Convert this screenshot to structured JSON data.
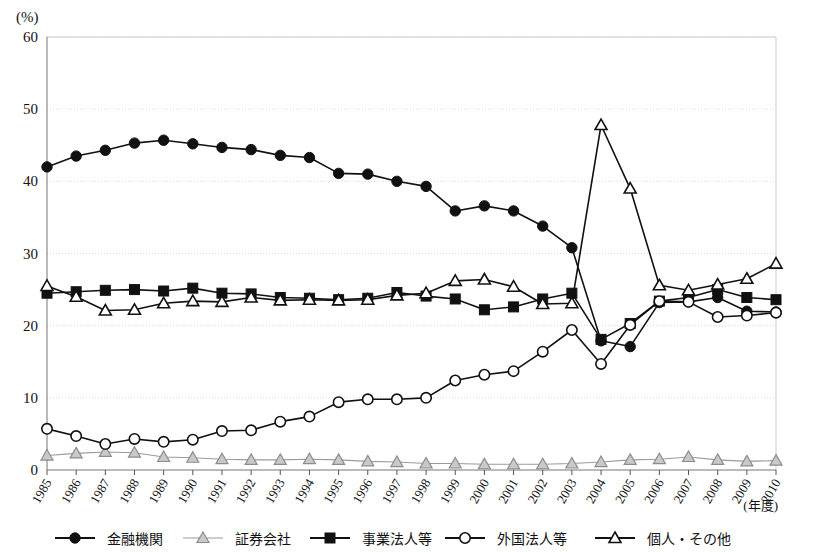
{
  "chart_data": {
    "type": "line",
    "title": "",
    "subtitle": "",
    "xlabel": "(年度)",
    "ylabel": "(%)",
    "ylim": [
      0,
      60
    ],
    "ytick_step": 10,
    "yticks": [
      "0",
      "10",
      "20",
      "30",
      "40",
      "50",
      "60"
    ],
    "grid": true,
    "legend_position": "bottom",
    "categories": [
      "1985",
      "1986",
      "1987",
      "1988",
      "1989",
      "1990",
      "1991",
      "1992",
      "1993",
      "1994",
      "1995",
      "1996",
      "1997",
      "1998",
      "1999",
      "2000",
      "2001",
      "2002",
      "2003",
      "2004",
      "2005",
      "2006",
      "2007",
      "2008",
      "2009",
      "2010"
    ],
    "series": [
      {
        "name": "金融機関",
        "marker": "filled-circle",
        "color": "#111111",
        "values": [
          42.0,
          43.5,
          44.3,
          45.3,
          45.7,
          45.2,
          44.7,
          44.4,
          43.6,
          43.3,
          41.1,
          41.0,
          40.0,
          39.3,
          35.9,
          36.6,
          35.9,
          33.8,
          30.8,
          17.9,
          17.1,
          23.2,
          23.3,
          23.9,
          22.0,
          21.9
        ]
      },
      {
        "name": "証券会社",
        "marker": "light-triangle",
        "color": "#9a9a9a",
        "values": [
          2.0,
          2.3,
          2.5,
          2.4,
          1.8,
          1.7,
          1.5,
          1.4,
          1.4,
          1.5,
          1.4,
          1.2,
          1.1,
          0.9,
          0.9,
          0.8,
          0.8,
          0.8,
          0.9,
          1.1,
          1.4,
          1.5,
          1.8,
          1.4,
          1.2,
          1.3
        ]
      },
      {
        "name": "事業法人等",
        "marker": "filled-square",
        "color": "#111111",
        "values": [
          24.5,
          24.7,
          24.9,
          25.0,
          24.8,
          25.2,
          24.5,
          24.4,
          23.9,
          23.8,
          23.6,
          23.8,
          24.6,
          24.1,
          23.7,
          22.2,
          22.6,
          23.7,
          24.5,
          18.1,
          20.3,
          23.4,
          23.9,
          25.0,
          23.9,
          23.6
        ]
      },
      {
        "name": "外国法人等",
        "marker": "open-circle",
        "color": "#111111",
        "values": [
          5.7,
          4.7,
          3.6,
          4.3,
          3.9,
          4.2,
          5.4,
          5.5,
          6.7,
          7.4,
          9.4,
          9.8,
          9.8,
          10.0,
          12.4,
          13.2,
          13.7,
          16.4,
          19.4,
          14.7,
          20.1,
          23.4,
          23.3,
          21.2,
          21.4,
          21.8
        ]
      },
      {
        "name": "個人・その他",
        "marker": "open-triangle",
        "color": "#111111",
        "values": [
          25.5,
          24.0,
          22.1,
          22.2,
          23.1,
          23.4,
          23.3,
          23.9,
          23.5,
          23.6,
          23.5,
          23.6,
          24.2,
          24.5,
          26.2,
          26.4,
          25.4,
          23.0,
          23.1,
          47.8,
          39.0,
          25.6,
          24.9,
          25.7,
          26.5,
          28.6
        ]
      }
    ]
  },
  "legend": {
    "items": [
      {
        "label": "金融機関",
        "marker": "filled-circle"
      },
      {
        "label": "証券会社",
        "marker": "light-triangle"
      },
      {
        "label": "事業法人等",
        "marker": "filled-square"
      },
      {
        "label": "外国法人等",
        "marker": "open-circle"
      },
      {
        "label": "個人・その他",
        "marker": "open-triangle"
      }
    ]
  },
  "axes": {
    "y_unit": "(%)",
    "x_unit": "(年度)"
  }
}
